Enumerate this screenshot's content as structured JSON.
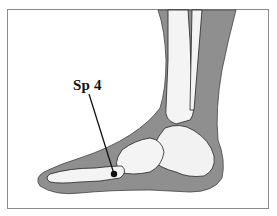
{
  "figure": {
    "point_label": "Sp 4",
    "colors": {
      "soft_tissue": "#8f8f8f",
      "bone": "#f4f4f4",
      "outline": "#222222",
      "frame_border": "#8a8a8a",
      "background": "#ffffff"
    }
  }
}
